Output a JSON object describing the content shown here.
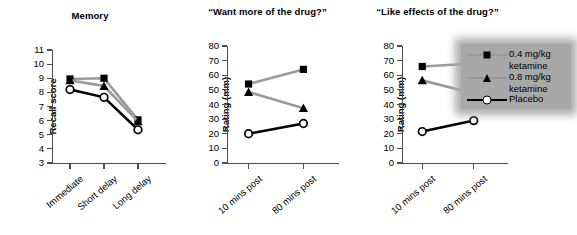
{
  "figure": {
    "width": 575,
    "height": 235,
    "background": "#ffffff"
  },
  "legend": {
    "name": "series-legend",
    "background_color": "#a8a8a8",
    "entries": [
      {
        "label": "0.4 mg/kg\nketamine",
        "marker": "filled-square",
        "color": "#9a9a9a",
        "marker_color": "#000000"
      },
      {
        "label": "0.8 mg/kg\nketamine",
        "marker": "filled-triangle",
        "color": "#9a9a9a",
        "marker_color": "#000000"
      },
      {
        "label": "Placebo",
        "marker": "open-circle",
        "color": "#000000",
        "marker_color": "#000000"
      }
    ]
  },
  "chart_data": [
    {
      "type": "line",
      "panel": "memory",
      "title": "Memory",
      "xlabel": "",
      "ylabel": "Recall score",
      "categories": [
        "Immediate",
        "Short delay",
        "Long delay"
      ],
      "ylim": [
        3,
        11
      ],
      "yticks": [
        3,
        4,
        5,
        6,
        7,
        8,
        9,
        10,
        11
      ],
      "grid": false,
      "legend_position": "outside-right",
      "series": [
        {
          "name": "0.4 mg/kg ketamine",
          "marker": "filled-square",
          "color": "#9a9a9a",
          "values": [
            8.95,
            9.0,
            6.05
          ]
        },
        {
          "name": "0.8 mg/kg ketamine",
          "marker": "filled-triangle",
          "color": "#9a9a9a",
          "values": [
            8.85,
            8.45,
            5.95
          ]
        },
        {
          "name": "Placebo",
          "marker": "open-circle",
          "color": "#000000",
          "values": [
            8.2,
            7.65,
            5.35
          ]
        }
      ]
    },
    {
      "type": "line",
      "panel": "want-more-of-the-drug",
      "title": "“Want more of the\ndrug?”",
      "xlabel": "",
      "ylabel": "Rating (mm)",
      "categories": [
        "10 mins post",
        "80 mins post"
      ],
      "ylim": [
        0,
        80
      ],
      "yticks": [
        0,
        10,
        20,
        30,
        40,
        50,
        60,
        70,
        80
      ],
      "grid": false,
      "legend_position": "outside-right",
      "series": [
        {
          "name": "0.4 mg/kg ketamine",
          "marker": "filled-square",
          "color": "#9a9a9a",
          "values": [
            54,
            64
          ]
        },
        {
          "name": "0.8 mg/kg ketamine",
          "marker": "filled-triangle",
          "color": "#9a9a9a",
          "values": [
            48.5,
            37.5
          ]
        },
        {
          "name": "Placebo",
          "marker": "open-circle",
          "color": "#000000",
          "values": [
            20,
            27
          ]
        }
      ]
    },
    {
      "type": "line",
      "panel": "like-effects-of-the-drug",
      "title": "“Like effects of the\ndrug?”",
      "xlabel": "",
      "ylabel": "Rating (mm)",
      "categories": [
        "10 mins post",
        "80 mins post"
      ],
      "ylim": [
        0,
        80
      ],
      "yticks": [
        0,
        10,
        20,
        30,
        40,
        50,
        60,
        70,
        80
      ],
      "grid": false,
      "legend_position": "outside-right",
      "series": [
        {
          "name": "0.4 mg/kg ketamine",
          "marker": "filled-square",
          "color": "#9a9a9a",
          "values": [
            66,
            68
          ]
        },
        {
          "name": "0.8 mg/kg ketamine",
          "marker": "filled-triangle",
          "color": "#9a9a9a",
          "values": [
            56.5,
            47.5
          ]
        },
        {
          "name": "Placebo",
          "marker": "open-circle",
          "color": "#000000",
          "values": [
            21.5,
            29
          ]
        }
      ]
    }
  ]
}
